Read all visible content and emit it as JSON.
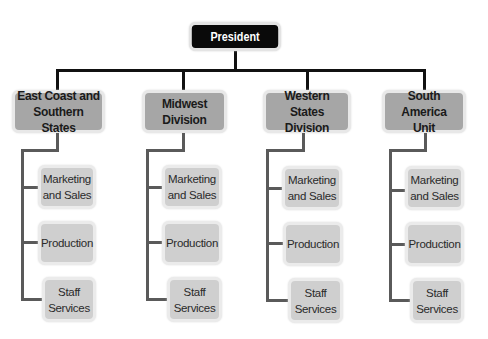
{
  "chart": {
    "root": {
      "label": "President"
    },
    "divisions": [
      {
        "label": "East Coast and\nSouthern States",
        "departments": [
          "Marketing\nand Sales",
          "Production",
          "Staff\nServices"
        ]
      },
      {
        "label": "Midwest\nDivision",
        "departments": [
          "Marketing\nand Sales",
          "Production",
          "Staff\nServices"
        ]
      },
      {
        "label": "Western States\nDivision",
        "departments": [
          "Marketing\nand Sales",
          "Production",
          "Staff\nServices"
        ]
      },
      {
        "label": "South America\nUnit",
        "departments": [
          "Marketing\nand Sales",
          "Production",
          "Staff\nServices"
        ]
      }
    ]
  },
  "colors": {
    "root_fill": "#0a0a0a",
    "division_fill": "#a6a6a6",
    "department_fill": "#cfcfcf",
    "connector_top": "#111111",
    "connector_sub": "#5a5a5a"
  }
}
